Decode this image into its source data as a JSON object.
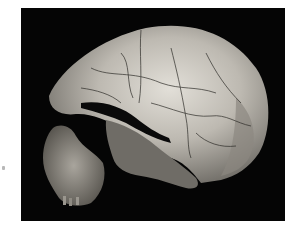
{
  "image": {
    "subject": "fossil-hominin-skull",
    "description": "Lateral view of a fossil hominin cranium with attached maxilla fragment, photographed on a black background",
    "colors": {
      "page_background": "#ffffff",
      "photo_background": "#050505",
      "bone_light": "#d6d3cc",
      "bone_mid": "#9e9a92",
      "bone_dark": "#4a4742",
      "crack": "#2a2825"
    }
  }
}
